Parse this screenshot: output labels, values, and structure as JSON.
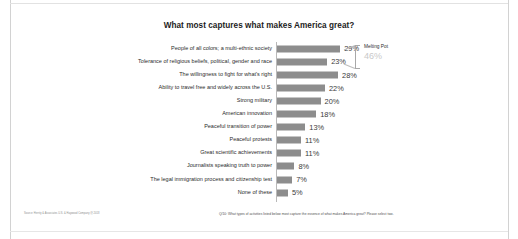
{
  "chart_data": {
    "type": "bar",
    "orientation": "horizontal",
    "title": "What most captures what makes America great?",
    "xlabel": "",
    "ylabel": "",
    "xlim": [
      0,
      30
    ],
    "grid": false,
    "legend": "none",
    "value_suffix": "%",
    "categories": [
      "People of all colors; a multi-ethnic society",
      "Tolerance of religious beliefs, political, gender and race",
      "The willingness to fight for what's right",
      "Ability to travel free and widely across the U.S.",
      "Strong military",
      "American innovation",
      "Peaceful transition of power",
      "Peaceful protests",
      "Great scientific achievements",
      "Journalists speaking truth to power",
      "The legal immigration process and citizenship test",
      "None of these"
    ],
    "values": [
      29,
      23,
      28,
      22,
      20,
      18,
      13,
      11,
      11,
      8,
      7,
      5
    ],
    "value_labels": [
      "29%",
      "23%",
      "28%",
      "22%",
      "20%",
      "18%",
      "13%",
      "11%",
      "11%",
      "8%",
      "7%",
      "5%"
    ],
    "annotations": [
      {
        "label": "Melting Pot",
        "value": "46%",
        "spans_categories": [
          "People of all colors; a multi-ethnic society",
          "Tolerance of religious beliefs, political, gender and race"
        ]
      }
    ],
    "bar_color": "#8d8d8d",
    "annotation_value_color": "#c9c9c9"
  },
  "footer": {
    "source": "Source: Herrity & Associates U.S. & Haywood Company @ 2018",
    "question": "Q/10: What types of activities listed below most capture the essence of what makes America great? Please select two."
  }
}
